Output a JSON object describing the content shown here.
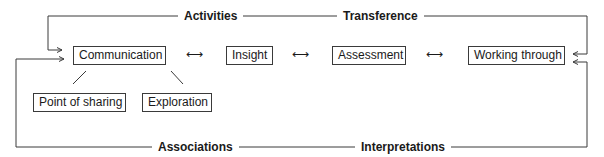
{
  "diagram": {
    "nodes": {
      "communication": "Communication",
      "insight": "Insight",
      "assessment": "Assessment",
      "working_through": "Working through",
      "point_of_sharing": "Point of sharing",
      "exploration": "Exploration"
    },
    "loop_labels": {
      "top_left": "Activities",
      "top_right": "Transference",
      "bottom_left": "Associations",
      "bottom_right": "Interpretations"
    },
    "connectors": {
      "bidirectional_arrow": "⟷"
    },
    "edges": [
      {
        "from": "communication",
        "to": "insight",
        "type": "bidirectional"
      },
      {
        "from": "insight",
        "to": "assessment",
        "type": "bidirectional"
      },
      {
        "from": "assessment",
        "to": "working_through",
        "type": "bidirectional"
      },
      {
        "from": "communication",
        "to": "point_of_sharing",
        "type": "line"
      },
      {
        "from": "communication",
        "to": "exploration",
        "type": "line"
      },
      {
        "from": "working_through",
        "to": "communication",
        "type": "top-loop",
        "labels": [
          "Activities",
          "Transference"
        ]
      },
      {
        "from": "working_through",
        "to": "communication",
        "type": "bottom-loop",
        "labels": [
          "Associations",
          "Interpretations"
        ]
      }
    ],
    "colors": {
      "line": "#3a3a3a",
      "text": "#1a1a1a",
      "background": "#ffffff"
    }
  }
}
